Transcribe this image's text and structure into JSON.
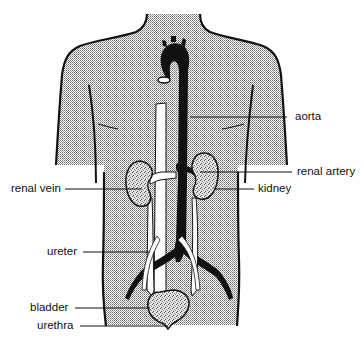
{
  "diagram": {
    "colors": {
      "outline": "#111111",
      "body_fill": "#d8d8d8",
      "vessel_dark": "#111111",
      "vessel_light": "#ffffff",
      "background": "#ffffff"
    },
    "labels": {
      "aorta": "aorta",
      "renal_artery": "renal artery",
      "renal_vein": "renal vein",
      "kidney": "kidney",
      "ureter": "ureter",
      "bladder": "bladder",
      "urethra": "urethra"
    }
  }
}
